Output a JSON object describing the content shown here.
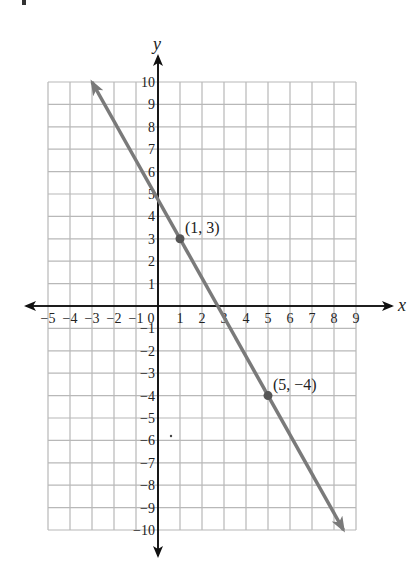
{
  "chart_data": {
    "type": "line",
    "title": "",
    "xlabel": "x",
    "ylabel": "y",
    "xlim": [
      -5,
      9
    ],
    "ylim": [
      -10,
      10
    ],
    "grid": true,
    "x_ticks": [
      -5,
      -4,
      -3,
      -2,
      -1,
      0,
      1,
      2,
      3,
      4,
      5,
      6,
      7,
      8,
      9
    ],
    "y_ticks": [
      -10,
      -9,
      -8,
      -7,
      -6,
      -5,
      -4,
      -3,
      -2,
      -1,
      1,
      2,
      3,
      4,
      5,
      6,
      7,
      8,
      9,
      10
    ],
    "x_tick_labels": [
      "−5",
      "−4",
      "−3",
      "−2",
      "−1",
      "0",
      "1",
      "2",
      "3",
      "4",
      "5",
      "6",
      "7",
      "8",
      "9"
    ],
    "y_tick_labels": [
      "−10",
      "−9",
      "−8",
      "−7",
      "−6",
      "−5",
      "−4",
      "−3",
      "−2",
      "−1",
      "1",
      "2",
      "3",
      "4",
      "5",
      "6",
      "7",
      "8",
      "9",
      "10"
    ],
    "series": [
      {
        "name": "line through (1, 3) and (5, −4)",
        "equation": "y = -7/4 x + 19/4",
        "slope": -1.75,
        "intercept": 4.75,
        "x": [
          -3,
          8.43
        ],
        "y": [
          10,
          -10
        ],
        "arrows": "both",
        "color": "#7a7a7a"
      }
    ],
    "points": [
      {
        "x": 1,
        "y": 3,
        "label": "(1, 3)"
      },
      {
        "x": 5,
        "y": -4,
        "label": "(5, −4)"
      }
    ],
    "annotations": [
      "(1, 3)",
      "(5, −4)"
    ]
  },
  "labels": {
    "x_axis": "x",
    "y_axis": "y",
    "point1": "(1, 3)",
    "point2": "(5, −4)"
  },
  "colors": {
    "grid": "#b8b8b8",
    "axis": "#111111",
    "line": "#7a7a7a",
    "point": "#555555"
  }
}
